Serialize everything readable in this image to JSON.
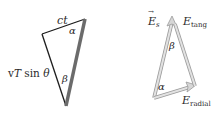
{
  "left_triangle": {
    "labels": {
      "top_side": "ct",
      "left_side_v": "v",
      "left_side_T": "T",
      "left_side_sin": " sin ",
      "left_side_theta": "θ",
      "angle_top": "α",
      "angle_bottom": "β"
    },
    "colors": {
      "outline": "#1a1a1a",
      "thick_side": "#6b6b6b"
    }
  },
  "right_triangle": {
    "labels": {
      "es_main": "E",
      "es_sub": "s",
      "es_arrow": "→",
      "tang_main": "E",
      "tang_sub": "tang",
      "radial_main": "E",
      "radial_sub": "radial",
      "angle_top": "β",
      "angle_bottom": "α"
    },
    "colors": {
      "vector": "#c4c4c4",
      "vector_outline": "#9a9a9a"
    }
  }
}
